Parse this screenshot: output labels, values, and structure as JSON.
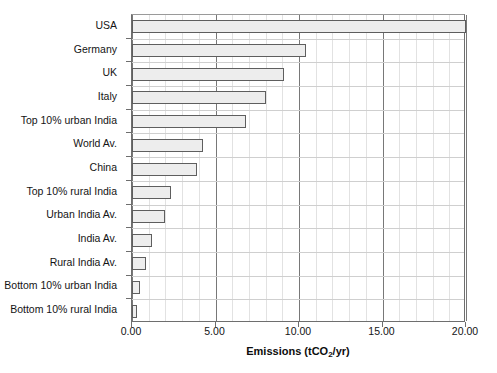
{
  "chart_data": {
    "type": "bar",
    "orientation": "horizontal",
    "title": "",
    "xlabel": "Emissions (tCO2/yr)",
    "xlabel_parts": {
      "pre": "Emissions (tCO",
      "sub": "2",
      "post": "/yr)"
    },
    "ylabel": "",
    "xlim": [
      0.0,
      20.0
    ],
    "xticks": [
      0.0,
      5.0,
      10.0,
      15.0,
      20.0
    ],
    "xtick_labels": [
      "0.00",
      "5.00",
      "10.00",
      "15.00",
      "20.00"
    ],
    "minor_tick_step": 1.0,
    "grid": true,
    "grid_axis": "x",
    "legend": null,
    "bar_fill_color": "#ededed",
    "bar_edge_color": "#5e5e5e",
    "categories": [
      "USA",
      "Germany",
      "UK",
      "Italy",
      "Top 10% urban India",
      "World Av.",
      "China",
      "Top 10% rural India",
      "Urban India Av.",
      "India Av.",
      "Rural India Av.",
      "Bottom 10% urban India",
      "Bottom 10% rural India"
    ],
    "values": [
      20.0,
      10.4,
      9.1,
      8.0,
      6.8,
      4.25,
      3.9,
      2.35,
      1.95,
      1.2,
      0.85,
      0.45,
      0.3
    ]
  }
}
